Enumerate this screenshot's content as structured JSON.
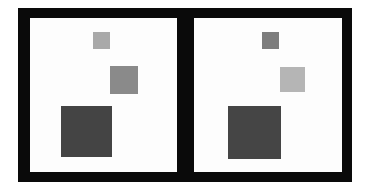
{
  "figure": {
    "frame_color": "#0a0a0a",
    "panel_background": "#fdfdfd",
    "panels": [
      {
        "id": "left",
        "squares": [
          {
            "role": "small",
            "color": "#a9a9a9",
            "x": 63,
            "y": 14,
            "size": 17
          },
          {
            "role": "medium",
            "color": "#8a8a8a",
            "x": 80,
            "y": 48,
            "size": 28
          },
          {
            "role": "large",
            "color": "#444444",
            "x": 31,
            "y": 88,
            "size": 51
          }
        ]
      },
      {
        "id": "right",
        "squares": [
          {
            "role": "small",
            "color": "#7d7d7d",
            "x": 68,
            "y": 14,
            "size": 17
          },
          {
            "role": "medium",
            "color": "#b5b5b5",
            "x": 86,
            "y": 49,
            "size": 25
          },
          {
            "role": "large",
            "color": "#454545",
            "x": 34,
            "y": 88,
            "size": 53
          }
        ]
      }
    ]
  }
}
